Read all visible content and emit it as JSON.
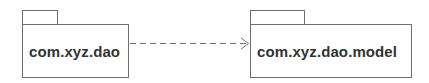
{
  "diagram": {
    "type": "uml-package-dependency",
    "packages": [
      {
        "id": "pkg-dao",
        "label": "com.xyz.dao"
      },
      {
        "id": "pkg-dao-model",
        "label": "com.xyz.dao.model"
      }
    ],
    "edges": [
      {
        "from": "pkg-dao",
        "to": "pkg-dao-model",
        "style": "dashed",
        "arrow": "open"
      }
    ],
    "colors": {
      "stroke": "#6f6f6f",
      "text": "#333333",
      "background": "#ffffff"
    }
  }
}
